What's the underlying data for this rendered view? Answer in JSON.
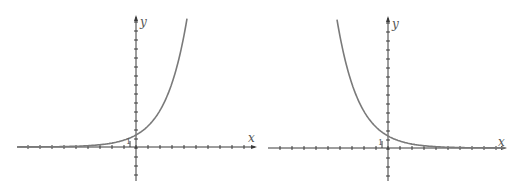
{
  "chart_data": [
    {
      "type": "line",
      "title": "",
      "description": "Exponential growth curve y = a^x (a > 1)",
      "xlabel": "x",
      "ylabel": "y",
      "y_intercept_label": "1",
      "grid": false,
      "xlim": [
        -10,
        10
      ],
      "ylim": [
        -3,
        11
      ],
      "series": [
        {
          "name": "growth",
          "x": [
            -10,
            -8,
            -6,
            -4,
            -2,
            -1,
            0,
            1,
            2,
            3,
            4
          ],
          "values": [
            0.0,
            0.01,
            0.02,
            0.06,
            0.25,
            0.5,
            1,
            2,
            4,
            7.2,
            11
          ]
        }
      ]
    },
    {
      "type": "line",
      "title": "",
      "description": "Exponential decay curve y = a^(-x) (a > 1)",
      "xlabel": "x",
      "ylabel": "y",
      "y_intercept_label": "1",
      "grid": false,
      "xlim": [
        -10,
        10
      ],
      "ylim": [
        -3,
        11
      ],
      "series": [
        {
          "name": "decay",
          "x": [
            -4,
            -3,
            -2,
            -1,
            0,
            1,
            2,
            4,
            6,
            8,
            10
          ],
          "values": [
            11,
            7.2,
            4,
            2,
            1,
            0.5,
            0.25,
            0.06,
            0.02,
            0.01,
            0.0
          ]
        }
      ]
    }
  ],
  "labels": {
    "left_x": "x",
    "left_y": "y",
    "left_one": "1",
    "right_x": "x",
    "right_y": "y",
    "right_one": "1"
  },
  "colors": {
    "axis": "#3a3a3a",
    "curve": "#7a7a7a",
    "background": "#ffffff"
  }
}
